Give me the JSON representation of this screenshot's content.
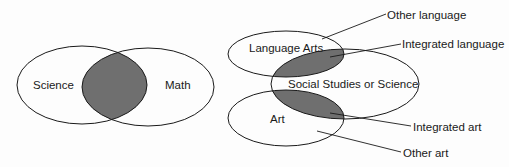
{
  "colors": {
    "stroke": "#1a1a1a",
    "shade": "#6f6f6f",
    "background": "#fdfdfd"
  },
  "left_diagram": {
    "sets": [
      {
        "label": "Science"
      },
      {
        "label": "Math"
      }
    ]
  },
  "right_diagram": {
    "sets": [
      {
        "label": "Language Arts"
      },
      {
        "label": "Social Studies or Science"
      },
      {
        "label": "Art"
      }
    ],
    "callouts": [
      {
        "label": "Other language"
      },
      {
        "label": "Integrated language"
      },
      {
        "label": "Integrated art"
      },
      {
        "label": "Other art"
      }
    ]
  }
}
